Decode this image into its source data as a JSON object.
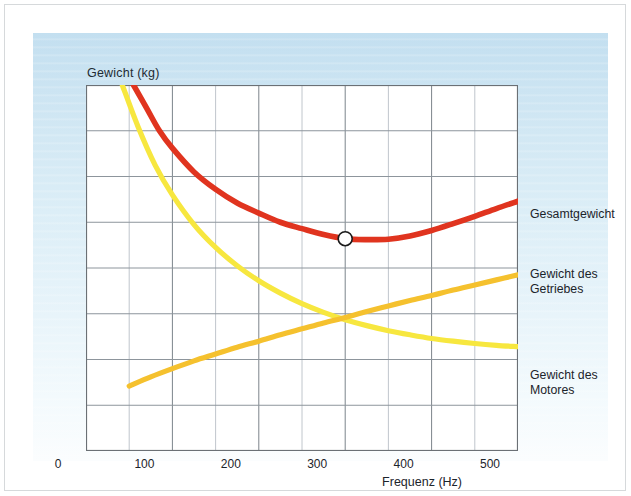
{
  "figure": {
    "y_axis_title": "Gewicht (kg)",
    "x_axis_title": "Frequenz (Hz)",
    "labels": {
      "total": "Gesamtgewicht",
      "gearbox": "Gewicht des\nGetriebes",
      "motor": "Gewicht des\nMotores"
    }
  },
  "colors": {
    "total_curve": "#e0341f",
    "gearbox_curve": "#f5c12e",
    "motor_curve": "#f7e73f",
    "panel_blue": "#cfe6f3",
    "grid": "#8d959c",
    "axis": "#6b7075",
    "text": "#1c242b"
  },
  "chart_data": {
    "type": "line",
    "title": "",
    "xlabel": "Frequenz (Hz)",
    "ylabel": "Gewicht (kg)",
    "xlim": [
      0,
      500
    ],
    "ylim": [
      0,
      8
    ],
    "xticks": [
      0,
      100,
      200,
      300,
      400,
      500
    ],
    "xtick_labels": [
      "0",
      "100",
      "200",
      "300",
      "400",
      "500"
    ],
    "yticks": [
      0,
      1,
      2,
      3,
      4,
      5,
      6,
      7,
      8
    ],
    "ytick_labels": [
      "",
      "",
      "",
      "",
      "",
      "",
      "",
      "",
      ""
    ],
    "grid": true,
    "grid_x_step": 50,
    "grid_y_step": 1,
    "legend_position": "right-inline",
    "annotations": [
      {
        "name": "optimum-marker",
        "type": "circle",
        "x": 300,
        "y": 4.64,
        "note": "Minimum des Gesamtgewichts"
      }
    ],
    "series": [
      {
        "name": "Gesamtgewicht",
        "color": "#e0341f",
        "x": [
          55,
          70,
          85,
          100,
          125,
          150,
          175,
          200,
          225,
          250,
          275,
          300,
          325,
          350,
          375,
          400,
          425,
          450,
          475,
          500
        ],
        "y": [
          8.0,
          7.5,
          7.0,
          6.62,
          6.1,
          5.72,
          5.42,
          5.2,
          5.0,
          4.86,
          4.73,
          4.64,
          4.62,
          4.63,
          4.7,
          4.82,
          4.97,
          5.13,
          5.3,
          5.46
        ]
      },
      {
        "name": "Gewicht des Getriebes",
        "color": "#f5c12e",
        "x": [
          50,
          75,
          100,
          125,
          150,
          175,
          200,
          225,
          250,
          275,
          300,
          325,
          350,
          375,
          400,
          425,
          450,
          475,
          500
        ],
        "y": [
          1.42,
          1.62,
          1.8,
          1.97,
          2.12,
          2.27,
          2.4,
          2.54,
          2.67,
          2.8,
          2.92,
          3.05,
          3.17,
          3.29,
          3.4,
          3.52,
          3.63,
          3.74,
          3.85
        ]
      },
      {
        "name": "Gewicht des Motores",
        "color": "#f7e73f",
        "x": [
          42,
          60,
          80,
          100,
          125,
          150,
          175,
          200,
          225,
          250,
          275,
          300,
          325,
          350,
          375,
          400,
          425,
          450,
          475,
          500
        ],
        "y": [
          8.0,
          7.1,
          6.25,
          5.6,
          4.95,
          4.45,
          4.05,
          3.72,
          3.45,
          3.22,
          3.03,
          2.87,
          2.74,
          2.63,
          2.54,
          2.46,
          2.4,
          2.35,
          2.31,
          2.28
        ]
      }
    ]
  }
}
